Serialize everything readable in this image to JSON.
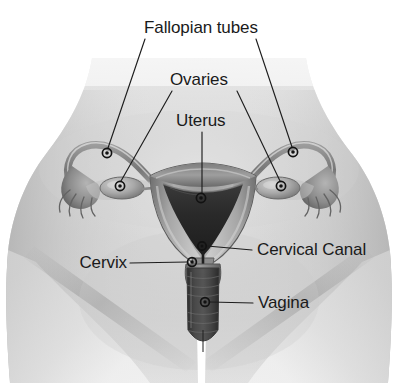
{
  "figure": {
    "background_color": "#ffffff",
    "width": 398,
    "height": 383,
    "label_color": "#1a1a1a",
    "leader_color": "#1d1d1d",
    "marker_color": "#121212"
  },
  "labels": {
    "fallopian_tubes": "Fallopian tubes",
    "ovaries": "Ovaries",
    "uterus": "Uterus",
    "cervical_canal": "Cervical Canal",
    "cervix": "Cervix",
    "vagina": "Vagina"
  },
  "annotations": [
    {
      "id": "fallopian-tubes",
      "label": "Fallopian tubes",
      "text_x": 144,
      "text_y": 33,
      "anchor": "start",
      "markers": [
        {
          "x": 107,
          "y": 153
        },
        {
          "x": 293,
          "y": 152
        }
      ]
    },
    {
      "id": "ovaries",
      "label": "Ovaries",
      "text_x": 170,
      "text_y": 85,
      "anchor": "start",
      "markers": [
        {
          "x": 120,
          "y": 186
        },
        {
          "x": 281,
          "y": 186
        }
      ]
    },
    {
      "id": "uterus",
      "label": "Uterus",
      "text_x": 176,
      "text_y": 126,
      "anchor": "start",
      "markers": [
        {
          "x": 201,
          "y": 198
        }
      ]
    },
    {
      "id": "cervical-canal",
      "label": "Cervical Canal",
      "text_x": 257,
      "text_y": 255,
      "anchor": "start",
      "markers": [
        {
          "x": 202,
          "y": 246
        }
      ]
    },
    {
      "id": "cervix",
      "label": "Cervix",
      "text_x": 127,
      "text_y": 268,
      "anchor": "end",
      "markers": [
        {
          "x": 192,
          "y": 262
        }
      ]
    },
    {
      "id": "vagina",
      "label": "Vagina",
      "text_x": 258,
      "text_y": 308,
      "anchor": "start",
      "markers": [
        {
          "x": 205,
          "y": 302
        }
      ]
    }
  ],
  "anatomy_parts": [
    "body-torso",
    "left-fallopian-tube",
    "right-fallopian-tube",
    "left-ovary",
    "right-ovary",
    "left-fimbriae",
    "right-fimbriae",
    "uterus-body",
    "uterine-cavity",
    "cervix-structure",
    "cervical-canal-structure",
    "vaginal-canal"
  ]
}
